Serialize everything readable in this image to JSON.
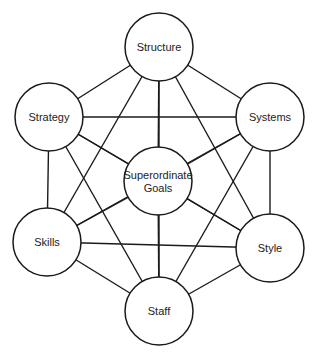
{
  "diagram": {
    "title": "",
    "nodes": [
      {
        "id": "structure",
        "label": [
          "Structure"
        ],
        "cx": 159,
        "cy": 47
      },
      {
        "id": "strategy",
        "label": [
          "Strategy"
        ],
        "cx": 49,
        "cy": 117
      },
      {
        "id": "systems",
        "label": [
          "Systems"
        ],
        "cx": 270,
        "cy": 117
      },
      {
        "id": "superordinate-goals",
        "label": [
          "Superordinate",
          "Goals"
        ],
        "cx": 158,
        "cy": 181
      },
      {
        "id": "skills",
        "label": [
          "Skills"
        ],
        "cx": 47,
        "cy": 242
      },
      {
        "id": "style",
        "label": [
          "Style"
        ],
        "cx": 270,
        "cy": 248
      },
      {
        "id": "staff",
        "label": [
          "Staff"
        ],
        "cx": 159,
        "cy": 311
      }
    ],
    "radius": 34,
    "edges": "all-pairs",
    "colors": {
      "stroke": "#1a1a1a",
      "fill": "#ffffff",
      "text": "#222222"
    }
  }
}
